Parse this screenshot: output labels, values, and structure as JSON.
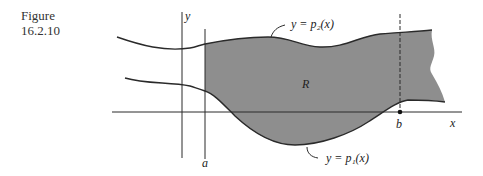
{
  "caption": {
    "line1": "Figure",
    "line2": "16.2.10"
  },
  "labels": {
    "y_axis": "y",
    "x_axis": "x",
    "a": "a",
    "b": "b",
    "region": "R",
    "upper_curve": "y = p₂(x)",
    "lower_curve": "y = p₁(x)"
  },
  "colors": {
    "region_fill": "#8e8e8e",
    "line": "#2a2a2a",
    "background": "#ffffff"
  }
}
